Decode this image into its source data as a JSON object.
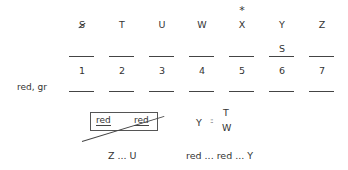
{
  "columns": [
    {
      "letter": "S",
      "crossed_out": true,
      "starred": false,
      "above_blank": "",
      "number": "1"
    },
    {
      "letter": "T",
      "crossed_out": false,
      "starred": false,
      "above_blank": "",
      "number": "2"
    },
    {
      "letter": "U",
      "crossed_out": false,
      "starred": false,
      "above_blank": "",
      "number": "3"
    },
    {
      "letter": "W",
      "crossed_out": false,
      "starred": false,
      "above_blank": "",
      "number": "4"
    },
    {
      "letter": "X",
      "crossed_out": false,
      "starred": true,
      "above_blank": "",
      "number": "5"
    },
    {
      "letter": "Y",
      "crossed_out": false,
      "starred": false,
      "above_blank": "S",
      "number": "6"
    },
    {
      "letter": "Z",
      "crossed_out": false,
      "starred": false,
      "above_blank": "",
      "number": "7"
    }
  ],
  "star_symbol": "*",
  "row_label": "red, gr",
  "crossed_box": {
    "left_word": "red",
    "right_word": "red"
  },
  "relation": {
    "left": "Y",
    "operator": "::",
    "top": "T",
    "bottom": "W"
  },
  "bottom_notes": [
    "Z ... U",
    "red ... red ... Y"
  ]
}
